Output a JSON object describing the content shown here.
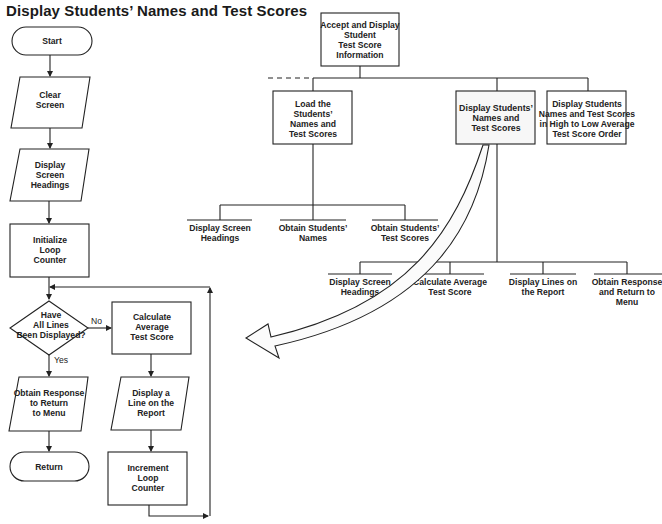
{
  "title": "Display Students’ Names and Test Scores",
  "flowchart": {
    "start": "Start",
    "clear_screen": [
      "Clear",
      "Screen"
    ],
    "display_headings": [
      "Display",
      "Screen",
      "Headings"
    ],
    "initialize_counter": [
      "Initialize",
      "Loop",
      "Counter"
    ],
    "decision": [
      "Have",
      "All Lines",
      "Been Displayed?"
    ],
    "decision_no": "No",
    "decision_yes": "Yes",
    "calculate_average": [
      "Calculate",
      "Average",
      "Test Score"
    ],
    "display_line": [
      "Display a",
      "Line on the",
      "Report"
    ],
    "increment_counter": [
      "Increment",
      "Loop",
      "Counter"
    ],
    "obtain_response": [
      "Obtain Response",
      "to Return",
      "to Menu"
    ],
    "return": "Return"
  },
  "hierarchy": {
    "root": [
      "Accept and Display",
      "Student",
      "Test Score",
      "Information"
    ],
    "level2": [
      {
        "lines": [
          "Load the",
          "Students’",
          "Names and",
          "Test Scores"
        ],
        "highlighted": false
      },
      {
        "lines": [
          "Display Students’",
          "Names and",
          "Test Scores"
        ],
        "highlighted": true
      },
      {
        "lines": [
          "Display Students",
          "Names and Test Scores",
          "in High to Low Average",
          "Test Score Order"
        ],
        "highlighted": false
      }
    ],
    "load_children": [
      [
        "Display Screen",
        "Headings"
      ],
      [
        "Obtain Students’",
        "Names"
      ],
      [
        "Obtain Students’",
        "Test Scores"
      ]
    ],
    "display_children": [
      [
        "Display Screen",
        "Headings"
      ],
      [
        "Calculate Average",
        "Test Score"
      ],
      [
        "Display Lines on",
        "the Report"
      ],
      [
        "Obtain Response",
        "and Return to",
        "Menu"
      ]
    ]
  }
}
